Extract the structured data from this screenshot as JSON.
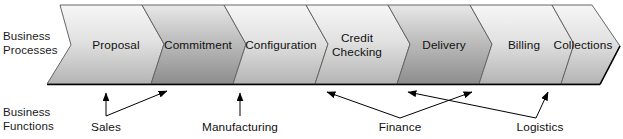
{
  "figure": {
    "row_labels": {
      "processes_line1": "Business",
      "processes_line2": "Processes",
      "functions_line1": "Business",
      "functions_line2": "Functions"
    },
    "stages": [
      {
        "id": "proposal",
        "label_line1": "Proposal",
        "label_line2": ""
      },
      {
        "id": "commitment",
        "label_line1": "Commitment",
        "label_line2": ""
      },
      {
        "id": "configuration",
        "label_line1": "Configuration",
        "label_line2": ""
      },
      {
        "id": "credit-checking",
        "label_line1": "Credit",
        "label_line2": "Checking"
      },
      {
        "id": "delivery",
        "label_line1": "Delivery",
        "label_line2": ""
      },
      {
        "id": "billing",
        "label_line1": "Billing",
        "label_line2": ""
      },
      {
        "id": "collections",
        "label_line1": "Collections",
        "label_line2": ""
      }
    ],
    "functions": [
      {
        "id": "sales",
        "label": "Sales"
      },
      {
        "id": "manufacturing",
        "label": "Manufacturing"
      },
      {
        "id": "finance",
        "label": "Finance"
      },
      {
        "id": "logistics",
        "label": "Logistics"
      }
    ],
    "colors": {
      "outline": "#555555",
      "band_light": "#f2f2f2",
      "band_dark": "#a8a8a8",
      "band_dark_alt": "#8f8f8f",
      "baseline": "#000000",
      "text": "#111111"
    }
  }
}
